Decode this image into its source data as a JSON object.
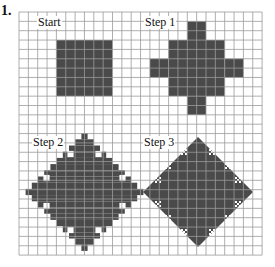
{
  "problem_number": "1.",
  "colors": {
    "grid": "#9a9a9a",
    "fill": "#4a4a4a",
    "hole": "#ffffff",
    "background": "#ffffff"
  },
  "grid": {
    "x0": 19,
    "y0": 12,
    "cell": 9.35,
    "cols": 26,
    "rows": 26
  },
  "panels": [
    {
      "label": "Start",
      "label_pos": [
        37,
        16
      ]
    },
    {
      "label": "Step 1",
      "label_pos": [
        144,
        16
      ]
    },
    {
      "label": "Step 2",
      "label_pos": [
        32,
        136
      ]
    },
    {
      "label": "Step 3",
      "label_pos": [
        143,
        136
      ]
    }
  ],
  "shapes": {
    "start": {
      "cells": [
        [
          4,
          3,
          6,
          6
        ]
      ]
    },
    "step1": {
      "cells": [
        [
          16,
          3,
          6,
          6
        ],
        [
          18,
          1,
          2,
          2
        ],
        [
          18,
          9,
          2,
          2
        ],
        [
          14,
          5,
          2,
          2
        ],
        [
          22,
          5,
          2,
          2
        ]
      ]
    },
    "step2": {
      "center": [
        84.5,
        192
      ],
      "radius": 55,
      "block": 6.2,
      "holes": [
        [
          -14,
          -38
        ],
        [
          14,
          -38
        ],
        [
          -38,
          -14
        ],
        [
          38,
          -14
        ],
        [
          -38,
          14
        ],
        [
          38,
          14
        ],
        [
          -14,
          38
        ],
        [
          14,
          38
        ]
      ]
    },
    "step3": {
      "center": [
        198,
        192
      ],
      "radius": 55,
      "holes": [
        [
          -30,
          -26
        ],
        [
          30,
          -26
        ],
        [
          -14,
          -40
        ],
        [
          14,
          -40
        ],
        [
          -40,
          -12
        ],
        [
          40,
          -12
        ],
        [
          -30,
          26
        ],
        [
          30,
          26
        ],
        [
          -14,
          40
        ],
        [
          14,
          40
        ],
        [
          -40,
          12
        ],
        [
          40,
          12
        ]
      ]
    }
  }
}
